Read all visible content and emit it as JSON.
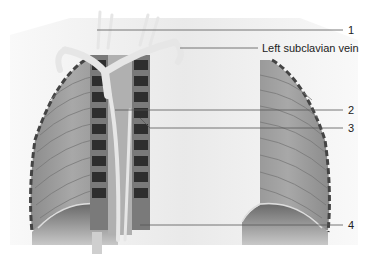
{
  "figure": {
    "colors": {
      "background": "#ffffff",
      "leader_line": "#555555",
      "text": "#222222"
    }
  },
  "labels": [
    {
      "id": "1",
      "text": "1"
    },
    {
      "id": "left-subclavian-vein",
      "text": "Left subclavian vein"
    },
    {
      "id": "2",
      "text": "2"
    },
    {
      "id": "3",
      "text": "3"
    },
    {
      "id": "4",
      "text": "4"
    }
  ]
}
